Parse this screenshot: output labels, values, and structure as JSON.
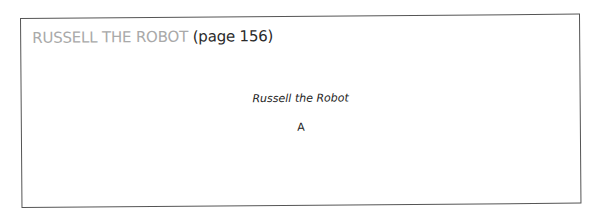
{
  "heading": {
    "title": "RUSSELL THE ROBOT",
    "page_ref": "(page 156)"
  },
  "content": {
    "caption": "Russell the Robot",
    "answer": "A"
  },
  "colors": {
    "title_gray": "#a9a9a9",
    "text_dark": "#222222",
    "border": "#555555"
  }
}
